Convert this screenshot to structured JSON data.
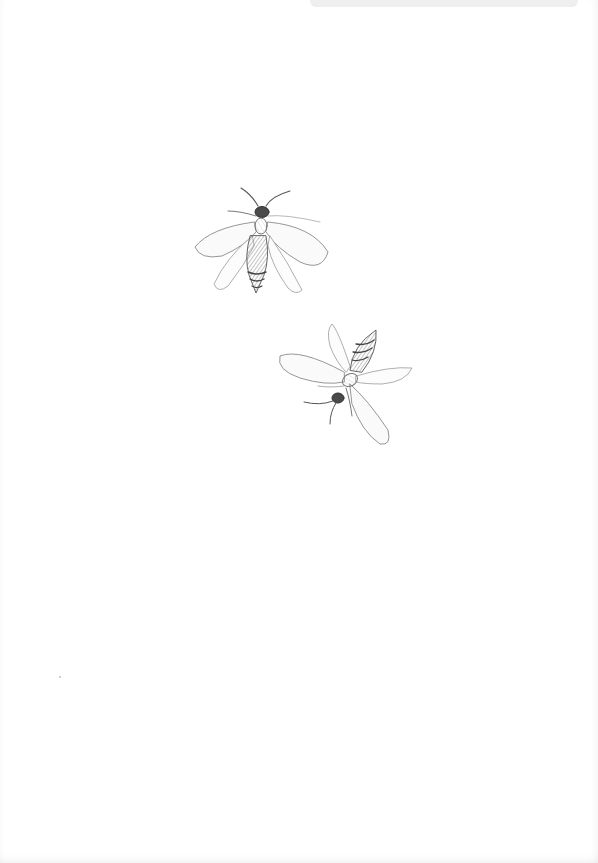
{
  "image": {
    "description": "Pencil drawing of two winged insects on white paper",
    "background_color": "#ffffff",
    "pencil_color": "#3a3a3a",
    "subjects": [
      {
        "name": "insect-top",
        "view": "dorsal, facing up",
        "center": [
          261,
          240
        ]
      },
      {
        "name": "insect-bottom",
        "view": "dorsal, rotated, head lower-left",
        "center": [
          348,
          380
        ]
      }
    ]
  }
}
